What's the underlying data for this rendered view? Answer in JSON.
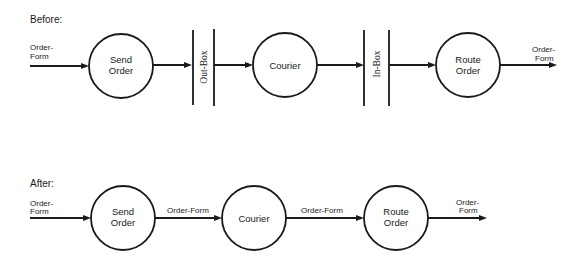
{
  "diagram": {
    "type": "dataflow",
    "colors": {
      "ink": "#1a1a1a",
      "background": "#ffffff"
    },
    "before": {
      "heading": "Before:",
      "input_flow": {
        "line1": "Order-",
        "line2": "Form"
      },
      "nodes": [
        {
          "id": "send-order",
          "line1": "Send",
          "line2": "Order"
        },
        {
          "id": "courier",
          "line1": "Courier"
        },
        {
          "id": "route-order",
          "line1": "Route",
          "line2": "Order"
        }
      ],
      "stores": [
        {
          "id": "out-box",
          "label": "Out-Box"
        },
        {
          "id": "in-box",
          "label": "In-Box"
        }
      ],
      "output_flow": {
        "line1": "Order-",
        "line2": "Form"
      }
    },
    "after": {
      "heading": "After:",
      "input_flow": {
        "line1": "Order-",
        "line2": "Form"
      },
      "nodes": [
        {
          "id": "send-order",
          "line1": "Send",
          "line2": "Order"
        },
        {
          "id": "courier",
          "line1": "Courier"
        },
        {
          "id": "route-order",
          "line1": "Route",
          "line2": "Order"
        }
      ],
      "flows": [
        {
          "from": "send-order",
          "to": "courier",
          "label": "Order-Form"
        },
        {
          "from": "courier",
          "to": "route-order",
          "label": "Order-Form"
        }
      ],
      "output_flow": {
        "line1": "Order-",
        "line2": "Form"
      }
    }
  }
}
